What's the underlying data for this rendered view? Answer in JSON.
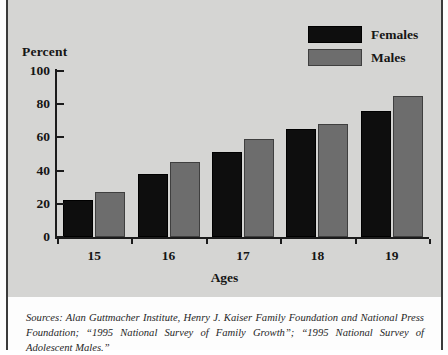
{
  "chart_data": {
    "type": "bar",
    "title": "",
    "xlabel": "Ages",
    "ylabel": "Percent",
    "categories": [
      "15",
      "16",
      "17",
      "18",
      "19"
    ],
    "series": [
      {
        "name": "Females",
        "color": "#0e0e0e",
        "values": [
          22,
          38,
          51,
          65,
          76
        ]
      },
      {
        "name": "Males",
        "color": "#6d6d6d",
        "values": [
          27,
          45,
          59,
          68,
          85
        ]
      }
    ],
    "ylim": [
      0,
      100
    ],
    "yticks": [
      0,
      20,
      40,
      60,
      80,
      100
    ],
    "ytick_labels": [
      "0",
      "20",
      "40",
      "60",
      "80",
      "100"
    ],
    "grid": false,
    "legend_position": "top-right"
  },
  "legend": {
    "items": [
      {
        "label": "Females",
        "color": "#0e0e0e"
      },
      {
        "label": "Males",
        "color": "#6d6d6d"
      }
    ]
  },
  "axes": {
    "y_title": "Percent",
    "x_title": "Ages"
  },
  "footer": {
    "source_note": "Sources: Alan Guttmacher Institute, Henry J. Kaiser Family Foundation and National Press Foundation; “1995 National Survey of Family Growth”; “1995 National Survey of Adolescent Males.”"
  },
  "colors": {
    "panel_background": "#d5d5d3",
    "page_background": "#fdfdfd",
    "axis": "#1b1b1b",
    "frame": "#3a3a3a",
    "text": "#151515"
  }
}
